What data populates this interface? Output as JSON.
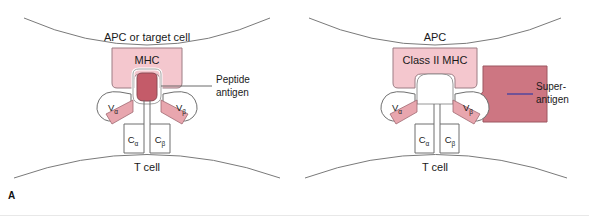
{
  "figure": {
    "type": "diagram",
    "width": 589,
    "height": 216,
    "background": "#ffffff"
  },
  "colors": {
    "mhc_fill": "#f4c7ce",
    "mhc_stroke": "#9c7d84",
    "peptide_fill": "#c45b69",
    "peptide_stroke": "#8d4a54",
    "superantigen_fill": "#cd7682",
    "superantigen_stroke": "#9c5660",
    "tcr_wedge_fill": "#e8a6ae",
    "tcr_wedge_stroke": "#a06a72",
    "outline": "#6f6f6f",
    "membrane": "#7a7a7a",
    "leader_gray": "#5a5a5a",
    "leader_purple": "#5b4a9c",
    "text": "#1a1a1a"
  },
  "panel_a": {
    "letter": "A",
    "top_cell_label": "APC or target cell",
    "bottom_cell_label": "T cell",
    "mhc_label": "MHC",
    "callout_line1": "Peptide",
    "callout_line2": "antigen",
    "tcr_domains": [
      {
        "name": "v-alpha",
        "base": "V",
        "sub": "α"
      },
      {
        "name": "v-beta",
        "base": "V",
        "sub": "β"
      },
      {
        "name": "c-alpha",
        "base": "C",
        "sub": "α"
      },
      {
        "name": "c-beta",
        "base": "C",
        "sub": "β"
      }
    ]
  },
  "panel_b": {
    "letter": "B",
    "top_cell_label": "APC",
    "bottom_cell_label": "T cell",
    "mhc_label": "Class II MHC",
    "callout_line1": "Super-",
    "callout_line2": "antigen",
    "tcr_domains": [
      {
        "name": "v-alpha",
        "base": "V",
        "sub": "α"
      },
      {
        "name": "v-beta",
        "base": "V",
        "sub": "β"
      },
      {
        "name": "c-alpha",
        "base": "C",
        "sub": "α"
      },
      {
        "name": "c-beta",
        "base": "C",
        "sub": "β"
      }
    ]
  }
}
